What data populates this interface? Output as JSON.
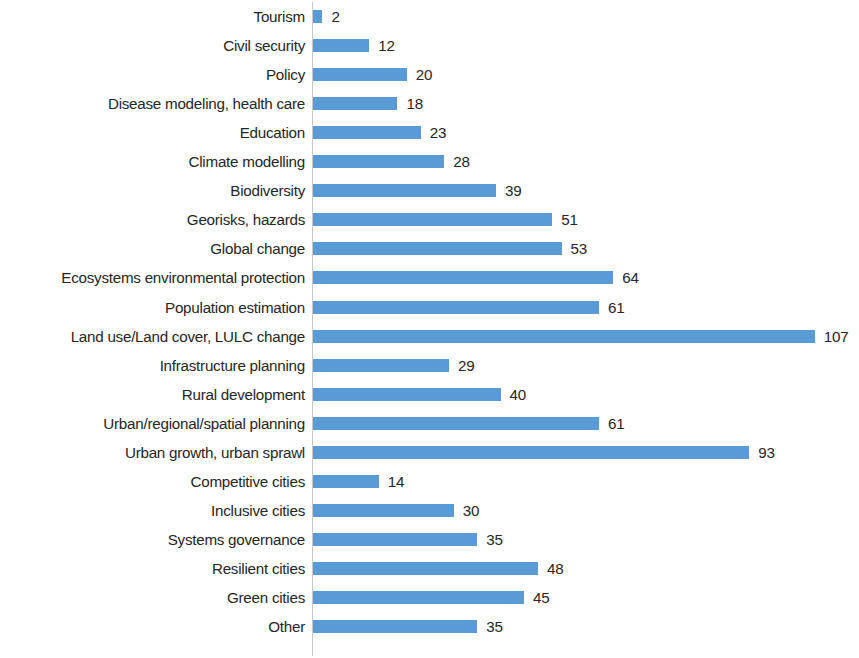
{
  "chart_data": {
    "type": "bar",
    "orientation": "horizontal",
    "title": "",
    "subtitle": "",
    "xlabel": "",
    "ylabel": "",
    "xlim": [
      0,
      107
    ],
    "grid": false,
    "legend": false,
    "legend_position": "none",
    "bar_color": "#5B9BD5",
    "label_color": "#262626",
    "background_color": "#FFFFFF",
    "axis_line_color": "#C8C8C8",
    "data_labels_shown": true,
    "categories": [
      "Tourism",
      "Civil security",
      "Policy",
      "Disease modeling, health care",
      "Education",
      "Climate modelling",
      "Biodiversity",
      "Georisks, hazards",
      "Global change",
      "Ecosystems environmental protection",
      "Population estimation",
      "Land use/Land cover, LULC change",
      "Infrastructure planning",
      "Rural development",
      "Urban/regional/spatial planning",
      "Urban growth, urban sprawl",
      "Competitive cities",
      "Inclusive cities",
      "Systems  governance",
      "Resilient cities",
      "Green cities",
      "Other"
    ],
    "values": [
      2,
      12,
      20,
      18,
      23,
      28,
      39,
      51,
      53,
      64,
      61,
      107,
      29,
      40,
      61,
      93,
      14,
      30,
      35,
      48,
      45,
      35
    ],
    "value_labels": [
      "2",
      "12",
      "20",
      "18",
      "23",
      "28",
      "39",
      "51",
      "53",
      "64",
      "61",
      "107",
      "29",
      "40",
      "61",
      "93",
      "14",
      "30",
      "35",
      "48",
      "45",
      "35"
    ]
  }
}
